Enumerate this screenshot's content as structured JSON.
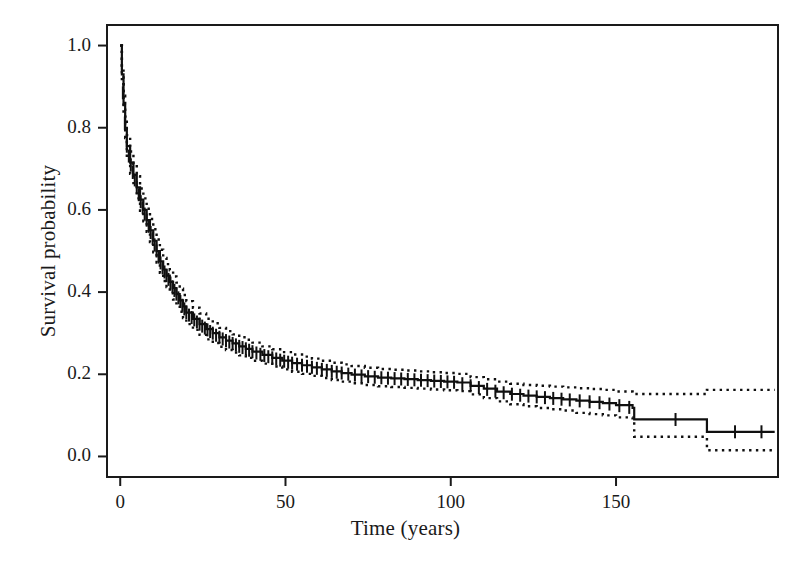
{
  "chart_data": {
    "type": "line",
    "title": "",
    "subtitle": "",
    "xlabel": "Time (years)",
    "ylabel": "Survival probability",
    "xlim": [
      -4,
      199
    ],
    "ylim": [
      -0.05,
      1.05
    ],
    "xticks": [
      0,
      50,
      100,
      150
    ],
    "xtick_labels": [
      "0",
      "50",
      "100",
      "150"
    ],
    "yticks": [
      0.0,
      0.2,
      0.4,
      0.6,
      0.8,
      1.0
    ],
    "ytick_labels": [
      "0.0",
      "0.2",
      "0.4",
      "0.6",
      "0.8",
      "1.0"
    ],
    "grid": false,
    "legend": null,
    "frame": "box",
    "annotations": [],
    "series": [
      {
        "name": "Kaplan-Meier survival estimate",
        "style": "solid",
        "color": "#101010",
        "x": [
          0,
          0.5,
          1,
          1.5,
          2,
          3,
          4,
          5,
          6,
          7,
          8,
          9,
          10,
          11,
          12,
          13,
          14,
          15,
          16,
          17,
          18,
          19,
          20,
          22,
          24,
          26,
          28,
          30,
          32,
          34,
          36,
          38,
          40,
          43,
          46,
          49,
          52,
          55,
          58,
          61,
          64,
          67,
          70,
          74,
          78,
          82,
          86,
          90,
          94,
          98,
          102,
          106,
          110,
          114,
          118,
          122,
          126,
          130,
          134,
          138,
          142,
          146,
          150,
          155,
          155.5,
          170,
          177,
          177.5,
          190,
          198
        ],
        "values": [
          1.0,
          0.93,
          0.855,
          0.8,
          0.755,
          0.715,
          0.685,
          0.655,
          0.625,
          0.6,
          0.575,
          0.55,
          0.525,
          0.5,
          0.475,
          0.455,
          0.44,
          0.425,
          0.41,
          0.395,
          0.38,
          0.365,
          0.35,
          0.335,
          0.322,
          0.31,
          0.3,
          0.29,
          0.282,
          0.275,
          0.268,
          0.262,
          0.255,
          0.247,
          0.24,
          0.233,
          0.227,
          0.222,
          0.217,
          0.212,
          0.207,
          0.203,
          0.199,
          0.195,
          0.192,
          0.19,
          0.188,
          0.186,
          0.184,
          0.182,
          0.18,
          0.172,
          0.165,
          0.158,
          0.152,
          0.148,
          0.145,
          0.142,
          0.139,
          0.136,
          0.133,
          0.13,
          0.125,
          0.118,
          0.09,
          0.09,
          0.09,
          0.06,
          0.06,
          0.06
        ]
      },
      {
        "name": "Upper 95% confidence limit",
        "style": "dotted",
        "color": "#101010",
        "x": [
          0,
          0.5,
          1,
          1.5,
          2,
          3,
          4,
          5,
          6,
          7,
          8,
          9,
          10,
          11,
          12,
          13,
          14,
          15,
          16,
          17,
          18,
          19,
          20,
          22,
          24,
          26,
          28,
          30,
          32,
          34,
          36,
          38,
          40,
          43,
          46,
          49,
          52,
          55,
          58,
          61,
          64,
          67,
          70,
          74,
          78,
          82,
          86,
          90,
          94,
          98,
          102,
          106,
          110,
          114,
          118,
          122,
          126,
          130,
          134,
          138,
          142,
          146,
          150,
          155,
          155.5,
          170,
          177,
          177.5,
          190,
          198
        ],
        "values": [
          1.0,
          0.945,
          0.878,
          0.825,
          0.782,
          0.742,
          0.712,
          0.682,
          0.652,
          0.628,
          0.603,
          0.578,
          0.553,
          0.528,
          0.503,
          0.483,
          0.468,
          0.453,
          0.438,
          0.423,
          0.408,
          0.393,
          0.378,
          0.362,
          0.348,
          0.335,
          0.324,
          0.313,
          0.305,
          0.297,
          0.29,
          0.284,
          0.277,
          0.268,
          0.261,
          0.254,
          0.248,
          0.243,
          0.238,
          0.233,
          0.228,
          0.224,
          0.22,
          0.216,
          0.213,
          0.211,
          0.209,
          0.207,
          0.205,
          0.203,
          0.201,
          0.193,
          0.188,
          0.182,
          0.177,
          0.174,
          0.172,
          0.17,
          0.168,
          0.166,
          0.164,
          0.162,
          0.158,
          0.152,
          0.152,
          0.152,
          0.152,
          0.162,
          0.162,
          0.162
        ]
      },
      {
        "name": "Lower 95% confidence limit",
        "style": "dotted",
        "color": "#101010",
        "x": [
          0,
          0.5,
          1,
          1.5,
          2,
          3,
          4,
          5,
          6,
          7,
          8,
          9,
          10,
          11,
          12,
          13,
          14,
          15,
          16,
          17,
          18,
          19,
          20,
          22,
          24,
          26,
          28,
          30,
          32,
          34,
          36,
          38,
          40,
          43,
          46,
          49,
          52,
          55,
          58,
          61,
          64,
          67,
          70,
          74,
          78,
          82,
          86,
          90,
          94,
          98,
          102,
          106,
          110,
          114,
          118,
          122,
          126,
          130,
          134,
          138,
          142,
          146,
          150,
          155,
          155.5,
          170,
          177,
          177.5,
          190,
          198
        ],
        "values": [
          1.0,
          0.915,
          0.832,
          0.775,
          0.728,
          0.688,
          0.658,
          0.628,
          0.598,
          0.572,
          0.547,
          0.522,
          0.497,
          0.472,
          0.447,
          0.427,
          0.412,
          0.397,
          0.382,
          0.367,
          0.352,
          0.337,
          0.322,
          0.308,
          0.296,
          0.285,
          0.276,
          0.267,
          0.259,
          0.253,
          0.246,
          0.24,
          0.233,
          0.226,
          0.219,
          0.212,
          0.206,
          0.201,
          0.196,
          0.191,
          0.186,
          0.182,
          0.178,
          0.174,
          0.171,
          0.169,
          0.167,
          0.165,
          0.163,
          0.161,
          0.159,
          0.151,
          0.142,
          0.134,
          0.127,
          0.122,
          0.118,
          0.115,
          0.112,
          0.106,
          0.103,
          0.1,
          0.095,
          0.088,
          0.048,
          0.048,
          0.048,
          0.015,
          0.015,
          0.015
        ]
      }
    ],
    "censor_marks": {
      "name": "Censored observations",
      "symbol": "plus-tick",
      "x": [
        0.8,
        1.4,
        2.0,
        2.6,
        3.2,
        3.8,
        4.4,
        5.0,
        5.6,
        6.2,
        6.8,
        7.4,
        8.0,
        8.6,
        9.2,
        9.8,
        10.4,
        11.0,
        11.6,
        12.2,
        12.8,
        13.4,
        14.0,
        14.6,
        15.2,
        15.8,
        16.4,
        17.0,
        17.6,
        18.2,
        18.8,
        19.4,
        20.0,
        20.8,
        21.6,
        22.4,
        23.2,
        24.0,
        24.8,
        25.6,
        26.4,
        27.2,
        28.0,
        29.0,
        30.0,
        31.0,
        32.0,
        33.0,
        34.0,
        35.0,
        36.0,
        37.0,
        38.0,
        39.0,
        40.0,
        41.2,
        42.4,
        43.6,
        44.8,
        46.0,
        47.2,
        48.4,
        49.6,
        50.8,
        52.0,
        53.5,
        55.0,
        56.5,
        58.0,
        59.5,
        61.0,
        62.5,
        64.0,
        65.5,
        67.0,
        69.0,
        71.0,
        73.0,
        75.0,
        77.0,
        79.0,
        81.0,
        83.0,
        85.0,
        87.0,
        89.0,
        91.0,
        93.0,
        95.0,
        97.0,
        99.0,
        101.0,
        103.5,
        106.0,
        108.5,
        111.0,
        113.5,
        116.0,
        118.5,
        121.0,
        123.5,
        126.0,
        128.5,
        131.0,
        133.5,
        136.0,
        139.0,
        142.0,
        145.0,
        148.0,
        151.0,
        154.0,
        168.0,
        186.0,
        194.0
      ]
    }
  }
}
